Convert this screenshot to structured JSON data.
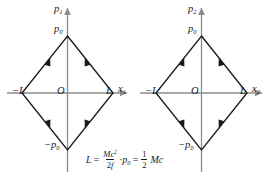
{
  "figure": {
    "background": "#ffffff",
    "line_color": "#1a1a1a",
    "axis_color": "#8c8c8c",
    "panels": [
      {
        "id": "left-panel",
        "vertical_axis_label": "p",
        "vertical_axis_sub": "1",
        "horizontal_axis_label": "x",
        "horizontal_axis_sub": "1",
        "origin_label": "O",
        "top_vertex_label": "p",
        "top_vertex_sub": "0",
        "bottom_vertex_label": "−p",
        "bottom_vertex_sub": "0",
        "left_vertex_label": "−L",
        "right_vertex_label": "L"
      },
      {
        "id": "right-panel",
        "vertical_axis_label": "p",
        "vertical_axis_sub": "2",
        "horizontal_axis_label": "x",
        "horizontal_axis_sub": "2",
        "origin_label": "O",
        "top_vertex_label": "p",
        "top_vertex_sub": "0",
        "bottom_vertex_label": "−p",
        "bottom_vertex_sub": "0",
        "left_vertex_label": "−L",
        "right_vertex_label": "L"
      }
    ],
    "caption": {
      "lhs": "L",
      "equals_1": "=",
      "frac1_num_M": "M",
      "frac1_num_c": "c",
      "frac1_num_exp": "2",
      "frac1_den_2": "2",
      "frac1_den_f": "f",
      "dot": "·",
      "p_symbol": "p",
      "p_sub": "0",
      "equals_2": "=",
      "frac2_num": "1",
      "frac2_den": "2",
      "tail_M": "M",
      "tail_c": "c",
      "full_text": "L = Mc²/2f · p₀ = ½ Mc"
    },
    "shape": {
      "type": "rhombus",
      "description": "closed diamond trajectory with arrowheads on each edge directed toward the top and bottom vertices"
    }
  }
}
